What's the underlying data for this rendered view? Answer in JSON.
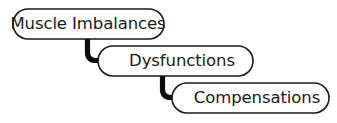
{
  "diagram": {
    "background_color": "#ffffff",
    "stroke_color": "#1a1a1a",
    "arrow_color": "#0d0d0d",
    "text_color": "#1a1a1a",
    "nodes": [
      {
        "id": "muscle-imbalances",
        "label": "Muscle Imbalances",
        "x": 13,
        "y": 9,
        "width": 151,
        "height": 30,
        "text_x": 88,
        "text_y": 24.5
      },
      {
        "id": "dysfunctions",
        "label": "Dysfunctions",
        "x": 98,
        "y": 46,
        "width": 155,
        "height": 30,
        "text_x": 182,
        "text_y": 61.5
      },
      {
        "id": "compensations",
        "label": "Compensations",
        "x": 172,
        "y": 83,
        "width": 157,
        "height": 30,
        "text_x": 257,
        "text_y": 98.5
      }
    ],
    "connectors": [
      {
        "id": "imbalances-to-dysfunctions",
        "from": "muscle-imbalances",
        "to": "dysfunctions",
        "path": "M 87.5 38 L 87.5 52 Q 87.5 60.5 96 60.5 L 104 60.5",
        "arrow_points": "103,54.5 117,60.8 103,67"
      },
      {
        "id": "dysfunctions-to-compensations",
        "from": "dysfunctions",
        "to": "compensations",
        "path": "M 162.5 75 L 162.5 89 Q 162.5 97.5 171 97.5 L 179 97.5",
        "arrow_points": "178,91.5 192,97.8 178,104"
      }
    ]
  }
}
